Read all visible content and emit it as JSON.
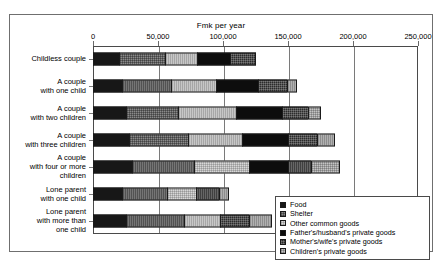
{
  "chart_data": {
    "type": "bar",
    "orientation": "horizontal",
    "stacked": true,
    "title": "Fmk per year",
    "xlabel": "Fmk per year",
    "ylabel": "",
    "xlim": [
      0,
      250000
    ],
    "xticks": [
      "0",
      "50,000",
      "100,000",
      "150,000",
      "200,000",
      "250,000"
    ],
    "xtick_values": [
      0,
      50000,
      100000,
      150000,
      200000,
      250000
    ],
    "grid": true,
    "legend_position": "bottom-right",
    "categories": [
      "Childless couple",
      "A couple\nwith one child",
      "A couple\nwith two children",
      "A couple\nwith three children",
      "A couple\nwith four or more\nchildren",
      "Lone parent\nwith one child",
      "Lone parent\nwith more than\none child"
    ],
    "series": [
      {
        "name": "Food",
        "pattern": "solid-black",
        "values": [
          20000,
          22000,
          25000,
          28000,
          30000,
          22000,
          25000
        ]
      },
      {
        "name": "Shelter",
        "pattern": "dark-hatch",
        "values": [
          35000,
          38000,
          40000,
          45000,
          48000,
          35000,
          45000
        ]
      },
      {
        "name": "Other common goods",
        "pattern": "light-hatch",
        "values": [
          25000,
          35000,
          45000,
          42000,
          42000,
          22000,
          28000
        ]
      },
      {
        "name": "Father's/husband's private goods",
        "pattern": "solid-black",
        "values": [
          25000,
          32000,
          35000,
          35000,
          30000,
          0,
          0
        ]
      },
      {
        "name": "Mother's/wife's private goods",
        "pattern": "dark-dot",
        "values": [
          20000,
          22000,
          20000,
          22000,
          18000,
          18000,
          22000
        ]
      },
      {
        "name": "Children's private goods",
        "pattern": "mid-hatch",
        "values": [
          0,
          8000,
          10000,
          14000,
          22000,
          8000,
          18000
        ]
      }
    ],
    "totals": [
      125000,
      157000,
      175000,
      186000,
      190000,
      105000,
      138000
    ]
  },
  "legend": {
    "items": [
      "Food",
      "Shelter",
      "Other common goods",
      "Father's/husband's private goods",
      "Mother's/wife's private goods",
      "Children's private goods"
    ]
  }
}
